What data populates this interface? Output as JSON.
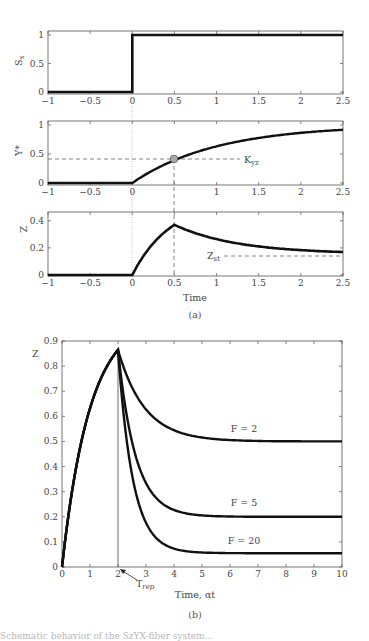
{
  "chart_data": [
    {
      "id": "a1",
      "type": "line",
      "panel": "(a) top",
      "ylabel": "S_x",
      "xlim": [
        -1,
        2.5
      ],
      "ylim": [
        0,
        1
      ],
      "xticks": [
        "-1",
        "-0.5",
        "0",
        "0.5",
        "1",
        "1.5",
        "2",
        "2.5"
      ],
      "yticks": [
        "0",
        "0.5",
        "1"
      ],
      "series": [
        {
          "name": "S_x",
          "x": [
            -1,
            0,
            0,
            2.5
          ],
          "values": [
            0,
            0,
            1,
            1
          ]
        }
      ],
      "annotations": [
        "dotted vertical line at t=0"
      ]
    },
    {
      "id": "a2",
      "type": "line",
      "panel": "(a) middle",
      "ylabel": "Y*",
      "xlim": [
        -1,
        2.5
      ],
      "ylim": [
        0,
        1
      ],
      "xticks": [
        "-1",
        "-0.5",
        "0",
        "",
        "1",
        "1.5",
        "2",
        "2.5"
      ],
      "yticks": [
        "0",
        "0.5",
        "1"
      ],
      "series": [
        {
          "name": "Y*",
          "x": [
            -1,
            0,
            0.25,
            0.5,
            0.75,
            1,
            1.5,
            2,
            2.5
          ],
          "values": [
            0,
            0,
            0.22,
            0.39,
            0.53,
            0.63,
            0.78,
            0.86,
            0.92
          ]
        }
      ],
      "annotations": [
        {
          "text": "K_yz",
          "x": 0.5,
          "y": 0.39,
          "marker": "grey circle with dashed guides"
        }
      ]
    },
    {
      "id": "a3",
      "type": "line",
      "panel": "(a) bottom",
      "ylabel": "Z",
      "xlabel": "Time",
      "xlim": [
        -1,
        2.5
      ],
      "ylim": [
        0,
        0.45
      ],
      "xticks": [
        "-1",
        "-0.5",
        "0",
        "0.5",
        "1",
        "1.5",
        "2",
        "2.5"
      ],
      "yticks": [
        "0",
        "0.2",
        "0.4"
      ],
      "series": [
        {
          "name": "Z",
          "x": [
            -1,
            0,
            0.25,
            0.5,
            1,
            1.5,
            2,
            2.5
          ],
          "values": [
            0,
            0,
            0.22,
            0.37,
            0.27,
            0.21,
            0.18,
            0.165
          ]
        }
      ],
      "annotations": [
        {
          "text": "Z_st",
          "y": 0.14,
          "style": "dashed horizontal"
        }
      ]
    },
    {
      "id": "b",
      "type": "line",
      "panel": "(b)",
      "ylabel": "Z",
      "xlabel": "Time, αt",
      "xlim": [
        0,
        10
      ],
      "ylim": [
        0,
        0.9
      ],
      "xticks": [
        "0",
        "1",
        "2",
        "3",
        "4",
        "5",
        "6",
        "7",
        "8",
        "9",
        "10"
      ],
      "yticks": [
        "0",
        "0.1",
        "0.2",
        "0.3",
        "0.4",
        "0.5",
        "0.6",
        "0.7",
        "0.8",
        "0.9"
      ],
      "series": [
        {
          "name": "F = 2",
          "x": [
            0,
            1,
            2,
            3,
            4,
            5,
            6,
            8,
            10
          ],
          "values": [
            0,
            0.63,
            0.865,
            0.63,
            0.55,
            0.52,
            0.505,
            0.5,
            0.5
          ]
        },
        {
          "name": "F = 5",
          "x": [
            0,
            1,
            2,
            3,
            4,
            5,
            6,
            8,
            10
          ],
          "values": [
            0,
            0.63,
            0.865,
            0.34,
            0.23,
            0.206,
            0.201,
            0.2,
            0.2
          ]
        },
        {
          "name": "F = 20",
          "x": [
            0,
            1,
            2,
            3,
            4,
            5,
            6,
            8,
            10
          ],
          "values": [
            0,
            0.63,
            0.865,
            0.26,
            0.11,
            0.07,
            0.058,
            0.055,
            0.055
          ]
        }
      ],
      "annotations": [
        {
          "text": "T_rep",
          "x": 2,
          "style": "arrow pointing to vertical line at t=2"
        }
      ]
    }
  ],
  "labels": {
    "a1_y": "S",
    "a1_y_sub": "x",
    "a2_y": "Y*",
    "a3_y": "Z",
    "a3_x": "Time",
    "kyz": "K",
    "kyz_sub": "yz",
    "zst": "Z",
    "zst_sub": "st",
    "cap_a": "(a)",
    "b_y": "Z",
    "b_x": "Time, αt",
    "trep": "T",
    "trep_sub": "rep",
    "f2": "F = 2",
    "f5": "F = 5",
    "f20": "F = 20",
    "cap_b": "(b)"
  },
  "caption_fragment": "Schematic behavior of the SzYX-fiber system..."
}
